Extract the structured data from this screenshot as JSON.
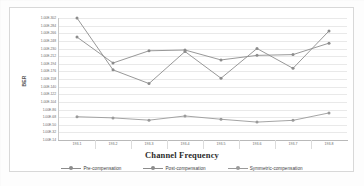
{
  "chart_data": {
    "type": "line",
    "title": "",
    "xlabel": "Channel Frequency",
    "ylabel": "BER",
    "categories": [
      "193.1",
      "193.2",
      "193.3",
      "193.4",
      "193.5",
      "193.6",
      "193.7",
      "193.8"
    ],
    "ytick_labels": [
      "1.00E-302",
      "1.00E-284",
      "1.00E-266",
      "1.00E-248",
      "1.00E-230",
      "1.00E-212",
      "1.00E-194",
      "1.00E-176",
      "1.00E-158",
      "1.00E-140",
      "1.00E-122",
      "1.00E-104",
      "1.00E-86",
      "1.00E-68",
      "1.00E-50",
      "1.00E-32",
      "1.00E-14"
    ],
    "ylim": [
      0,
      16
    ],
    "grid": true,
    "legend_position": "bottom",
    "series": [
      {
        "name": "Pre-compensation",
        "color": "#8c8c8c",
        "values": [
          16.0,
          9.2,
          7.4,
          11.6,
          8.1,
          12.0,
          9.4,
          14.3
        ]
      },
      {
        "name": "Post-compensation",
        "color": "#8c8c8c",
        "values": [
          13.5,
          10.1,
          11.7,
          11.8,
          10.5,
          11.1,
          11.2,
          12.7
        ]
      },
      {
        "name": "Symmetric-compensation",
        "color": "#9a9a9a",
        "values": [
          3.05,
          2.9,
          2.6,
          3.15,
          2.72,
          2.35,
          2.58,
          3.55
        ]
      }
    ]
  },
  "legend": {
    "items": [
      {
        "label": "Pre-compensation"
      },
      {
        "label": "Post-compensation"
      },
      {
        "label": "Symmetric-compensation"
      }
    ]
  }
}
